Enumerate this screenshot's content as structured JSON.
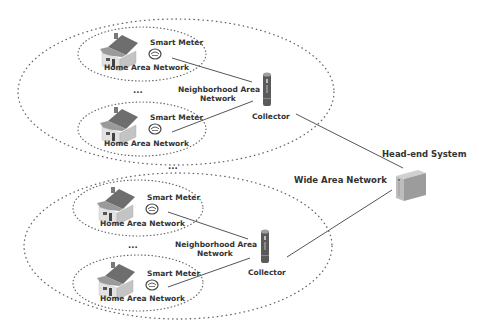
{
  "diagram": {
    "colors": {
      "line": "#555555",
      "dots": "#666666",
      "text": "#333333",
      "house_roof": "#6e6e6e",
      "house_wall": "#d9d9d9",
      "collector": "#5a5a5a",
      "server": "#a8a8a8"
    },
    "labels": {
      "smart_meter": "Smart Meter",
      "home_area_network": "Home Area Network",
      "neighborhood_area_network_line1": "Neighborhood Area",
      "neighborhood_area_network_line2": "Network",
      "collector": "Collector",
      "wide_area_network": "Wide Area Network",
      "head_end_system": "Head-end System",
      "ellipsis": "..."
    },
    "neighborhoods": [
      {
        "id": "nan-top",
        "homes": [
          {
            "id": "han-1",
            "label": "Home Area Network",
            "meter": "Smart Meter"
          },
          {
            "id": "han-2",
            "label": "Home Area Network",
            "meter": "Smart Meter"
          }
        ],
        "collector": "Collector"
      },
      {
        "id": "nan-bottom",
        "homes": [
          {
            "id": "han-3",
            "label": "Home Area Network",
            "meter": "Smart Meter"
          },
          {
            "id": "han-4",
            "label": "Home Area Network",
            "meter": "Smart Meter"
          }
        ],
        "collector": "Collector"
      }
    ]
  }
}
